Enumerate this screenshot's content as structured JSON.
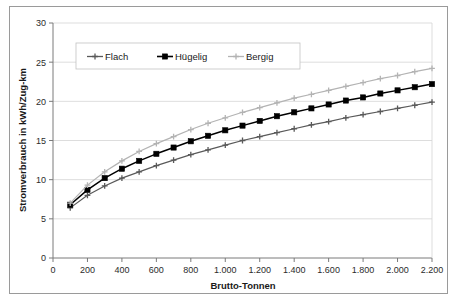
{
  "chart_data": {
    "type": "line",
    "title": "",
    "xlabel": "Brutto-Tonnen",
    "ylabel": "Stromverbrauch in kWh/Zug-km",
    "xlim": [
      0,
      2200
    ],
    "ylim": [
      0,
      30
    ],
    "grid": true,
    "grid_axis": "y",
    "legend_position": "top-left-inside",
    "xticks": [
      0,
      200,
      400,
      600,
      800,
      1000,
      1200,
      1400,
      1600,
      1800,
      2000,
      2200
    ],
    "xtick_labels": [
      "0",
      "200",
      "400",
      "600",
      "800",
      "1.000",
      "1.200",
      "1.400",
      "1.600",
      "1.800",
      "2.000",
      "2.200"
    ],
    "yticks": [
      0,
      5,
      10,
      15,
      20,
      25,
      30
    ],
    "ytick_labels": [
      "0",
      "5",
      "10",
      "15",
      "20",
      "25",
      "30"
    ],
    "x": [
      100,
      200,
      300,
      400,
      500,
      600,
      700,
      800,
      900,
      1000,
      1100,
      1200,
      1300,
      1400,
      1500,
      1600,
      1700,
      1800,
      1900,
      2000,
      2100,
      2200
    ],
    "series": [
      {
        "name": "Flach",
        "color": "#595959",
        "marker": "cross",
        "values": [
          6.4,
          8.0,
          9.2,
          10.2,
          11.0,
          11.8,
          12.5,
          13.2,
          13.8,
          14.4,
          15.0,
          15.5,
          16.0,
          16.5,
          17.0,
          17.4,
          17.9,
          18.3,
          18.7,
          19.1,
          19.5,
          19.9
        ]
      },
      {
        "name": "Hügelig",
        "color": "#000000",
        "marker": "square",
        "values": [
          6.8,
          8.7,
          10.2,
          11.4,
          12.4,
          13.3,
          14.1,
          14.9,
          15.6,
          16.3,
          16.9,
          17.5,
          18.1,
          18.6,
          19.1,
          19.6,
          20.1,
          20.5,
          21.0,
          21.4,
          21.8,
          22.2
        ]
      },
      {
        "name": "Bergig",
        "color": "#b3b3b3",
        "marker": "cross",
        "values": [
          7.0,
          9.3,
          11.0,
          12.4,
          13.6,
          14.6,
          15.5,
          16.4,
          17.2,
          17.9,
          18.6,
          19.2,
          19.8,
          20.4,
          20.9,
          21.4,
          21.9,
          22.4,
          22.9,
          23.3,
          23.8,
          24.2
        ]
      }
    ]
  },
  "legend": {
    "items": [
      {
        "label": "Flach"
      },
      {
        "label": "Hügelig"
      },
      {
        "label": "Bergig"
      }
    ]
  }
}
